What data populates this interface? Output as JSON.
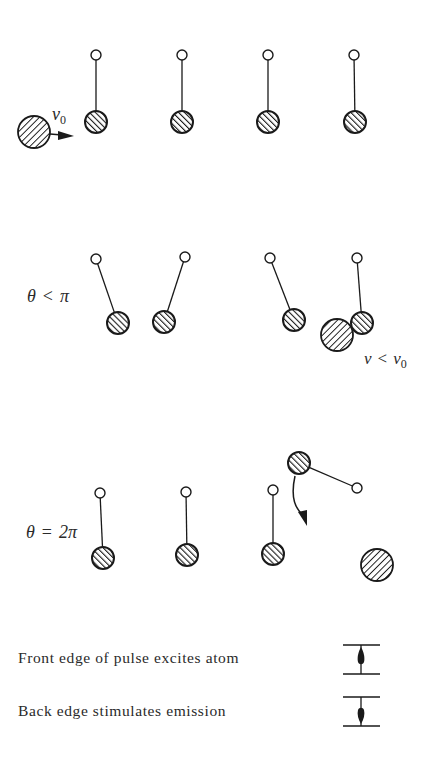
{
  "diagram": {
    "colors": {
      "ink": "#1a1a1a",
      "background": "#ffffff"
    },
    "rows": [
      {
        "id": "row-initial",
        "label": "",
        "incoming_atom": {
          "cx": 34,
          "cy": 132,
          "r": 16
        },
        "velocity_label": "v",
        "velocity_sub": "0",
        "pendulums": [
          {
            "pivot": [
              96,
              55
            ],
            "bob": [
              96,
              122
            ]
          },
          {
            "pivot": [
              182,
              55
            ],
            "bob": [
              182,
              122
            ]
          },
          {
            "pivot": [
              268,
              55
            ],
            "bob": [
              268,
              122
            ]
          },
          {
            "pivot": [
              354,
              55
            ],
            "bob": [
              355,
              122
            ]
          }
        ]
      },
      {
        "id": "row-theta-lt-pi",
        "label_theta": "θ",
        "label_rel": "<",
        "label_value": "π",
        "pendulums": [
          {
            "pivot": [
              96,
              259
            ],
            "bob": [
              118,
              323
            ]
          },
          {
            "pivot": [
              185,
              257
            ],
            "bob": [
              164,
              322
            ]
          },
          {
            "pivot": [
              270,
              258
            ],
            "bob": [
              294,
              320
            ]
          },
          {
            "pivot": [
              357,
              258
            ],
            "bob": [
              362,
              323
            ]
          }
        ],
        "atom": {
          "cx": 337,
          "cy": 335,
          "r": 16
        },
        "speed_label_v": "v",
        "speed_label_rel": "<",
        "speed_label_v0": "v",
        "speed_label_v0_sub": "0"
      },
      {
        "id": "row-theta-2pi",
        "label_theta": "θ",
        "label_rel": "=",
        "label_value": "2π",
        "pendulums": [
          {
            "pivot": [
              100,
              493
            ],
            "bob": [
              103,
              558
            ]
          },
          {
            "pivot": [
              186,
              492
            ],
            "bob": [
              187,
              555
            ]
          },
          {
            "pivot": [
              273,
              490
            ],
            "bob": [
              273,
              554
            ]
          },
          {
            "pivot": [
              357,
              488
            ],
            "bob": [
              299,
              463
            ]
          }
        ],
        "swing_arrow": {
          "from": [
            295,
            476
          ],
          "to": [
            306,
            526
          ]
        },
        "outgoing_atom": {
          "cx": 377,
          "cy": 565,
          "r": 16
        }
      }
    ],
    "legend": [
      {
        "text": "Front edge of pulse excites atom",
        "icon": "pulse-front-edge-icon"
      },
      {
        "text": "Back edge stimulates emission",
        "icon": "pulse-back-edge-icon"
      }
    ]
  }
}
